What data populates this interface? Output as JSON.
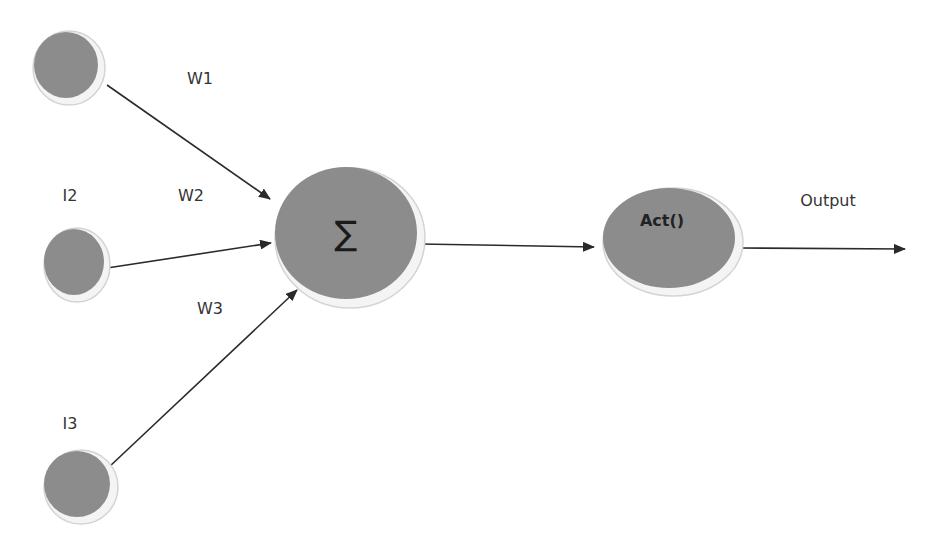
{
  "diagram": {
    "colors": {
      "node_fill": "#8c8c8c",
      "node_rim": "#f4f4f4",
      "edge": "#2a2a2a",
      "text": "#333333"
    },
    "inputs": [
      {
        "id": "i1",
        "label": ""
      },
      {
        "id": "i2",
        "label": "I2"
      },
      {
        "id": "i3",
        "label": "I3"
      }
    ],
    "weights": [
      {
        "id": "w1",
        "label": "W1"
      },
      {
        "id": "w2",
        "label": "W2"
      },
      {
        "id": "w3",
        "label": "W3"
      }
    ],
    "summation": {
      "label": "∑"
    },
    "activation": {
      "label": "Act()"
    },
    "output": {
      "label": "Output"
    }
  }
}
